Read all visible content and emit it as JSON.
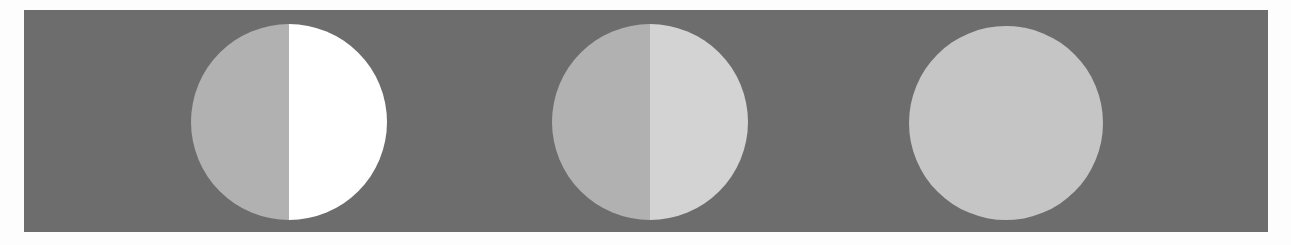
{
  "figure": {
    "background_band_color": "#6d6d6d",
    "page_background": "#fdfdfd"
  },
  "discs": [
    {
      "id": "disc-1",
      "center": [
        289,
        122
      ],
      "radius": 98,
      "split": true,
      "left_color": "#b1b1b1",
      "right_color": "#ffffff"
    },
    {
      "id": "disc-2",
      "center": [
        650,
        122
      ],
      "radius": 98,
      "split": true,
      "left_color": "#b1b1b1",
      "right_color": "#d3d3d3"
    },
    {
      "id": "disc-3",
      "center": [
        1006,
        123
      ],
      "radius": 97,
      "split": false,
      "fill_color": "#c5c5c5"
    }
  ]
}
